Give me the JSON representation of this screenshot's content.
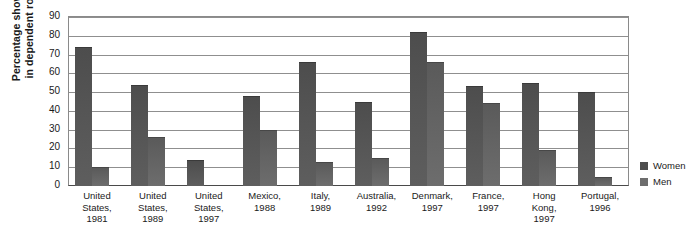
{
  "chart_data": {
    "type": "bar",
    "title": "",
    "xlabel": "",
    "ylabel_line1": "Percentage shown",
    "ylabel_line2": "in dependent role",
    "ylim": [
      0,
      90
    ],
    "yticks": [
      0,
      10,
      20,
      30,
      40,
      50,
      60,
      70,
      80,
      90
    ],
    "grid": true,
    "legend_position": "right",
    "categories": [
      "United States, 1981",
      "United States, 1989",
      "United States, 1997",
      "Mexico, 1988",
      "Italy, 1989",
      "Australia, 1992",
      "Denmark, 1997",
      "France, 1997",
      "Hong Kong, 1997",
      "Portugal, 1996"
    ],
    "category_lines": [
      [
        "United",
        "States,",
        "1981"
      ],
      [
        "United",
        "States,",
        "1989"
      ],
      [
        "United",
        "States,",
        "1997"
      ],
      [
        "Mexico,",
        "1988"
      ],
      [
        "Italy,",
        "1989"
      ],
      [
        "Australia,",
        "1992"
      ],
      [
        "Denmark,",
        "1997"
      ],
      [
        "France,",
        "1997"
      ],
      [
        "Hong",
        "Kong,",
        "1997"
      ],
      [
        "Portugal,",
        "1996"
      ]
    ],
    "series": [
      {
        "name": "Women",
        "color": "#4d4d4d",
        "values": [
          74,
          54,
          14,
          48,
          66,
          45,
          82,
          53,
          55,
          50
        ]
      },
      {
        "name": "Men",
        "color": "#6d6d6d",
        "values": [
          10,
          26,
          null,
          30,
          13,
          15,
          66,
          44,
          19,
          5
        ]
      }
    ]
  },
  "legend": {
    "items": [
      {
        "label": "Women",
        "color": "#4d4d4d"
      },
      {
        "label": "Men",
        "color": "#6d6d6d"
      }
    ]
  }
}
